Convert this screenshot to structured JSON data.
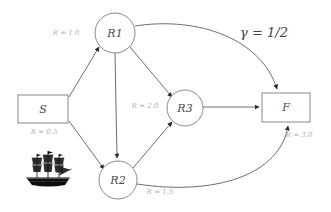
{
  "diagram": {
    "type": "directed-graph",
    "parameter": {
      "label": "γ = 1/2",
      "symbol": "γ",
      "value": "1/2"
    },
    "nodes": [
      {
        "id": "S",
        "label": "S",
        "shape": "rect",
        "rate_label": "R = 0.5",
        "rate": 0.5,
        "cx": 43,
        "cy": 109
      },
      {
        "id": "R1",
        "label": "R1",
        "shape": "circle",
        "rate_label": "R = 1.0",
        "rate": 1.0,
        "cx": 115,
        "cy": 33
      },
      {
        "id": "R2",
        "label": "R2",
        "shape": "circle",
        "rate_label": "R = 1.5",
        "rate": 1.5,
        "cx": 118,
        "cy": 180
      },
      {
        "id": "R3",
        "label": "R3",
        "shape": "circle",
        "rate_label": "R = 2.0",
        "rate": 2.0,
        "cx": 185,
        "cy": 108
      },
      {
        "id": "F",
        "label": "F",
        "shape": "rect",
        "rate_label": "R = 3.0",
        "rate": 3.0,
        "cx": 286,
        "cy": 107
      }
    ],
    "edges": [
      {
        "from": "S",
        "to": "R1",
        "style": "straight"
      },
      {
        "from": "S",
        "to": "R2",
        "style": "straight"
      },
      {
        "from": "R1",
        "to": "R2",
        "style": "straight"
      },
      {
        "from": "R1",
        "to": "R3",
        "style": "straight"
      },
      {
        "from": "R2",
        "to": "R3",
        "style": "straight"
      },
      {
        "from": "R3",
        "to": "F",
        "style": "straight"
      },
      {
        "from": "R1",
        "to": "F",
        "style": "curved"
      },
      {
        "from": "R2",
        "to": "F",
        "style": "curved"
      }
    ],
    "decoration": {
      "icon": "sailing-ship-icon",
      "near_node": "S"
    }
  }
}
